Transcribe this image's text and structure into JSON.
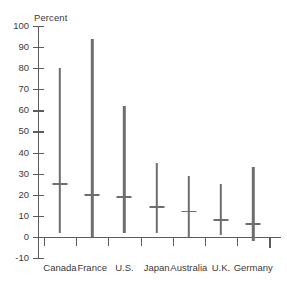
{
  "chart_data": {
    "type": "bar",
    "subtype": "range-with-median-marker",
    "title": "",
    "xlabel": "",
    "ylabel": "Percent",
    "ylim": [
      -10,
      100
    ],
    "yticks": [
      100,
      90,
      80,
      70,
      60,
      50,
      40,
      30,
      20,
      10,
      0,
      -10
    ],
    "ytick_labels": [
      "100",
      "90",
      "80",
      "70",
      "60",
      "50",
      "40",
      "30",
      "20",
      "10",
      "0",
      "-10"
    ],
    "grid": false,
    "legend": false,
    "categories": [
      "Canada",
      "France",
      "U.S.",
      "Japan",
      "Australia",
      "U.K.",
      "Germany"
    ],
    "series": [
      {
        "name": "Range maximum",
        "values": [
          80,
          94,
          62,
          35,
          29,
          25,
          33
        ]
      },
      {
        "name": "Range minimum",
        "values": [
          2,
          0,
          2,
          2,
          0,
          1,
          -2
        ]
      },
      {
        "name": "Median marker",
        "values": [
          25,
          20,
          19,
          14,
          12,
          8,
          6
        ]
      }
    ],
    "points": [
      {
        "category": "Canada",
        "min": 2,
        "max": 80,
        "median": 25
      },
      {
        "category": "France",
        "min": 0,
        "max": 94,
        "median": 20
      },
      {
        "category": "U.S.",
        "min": 2,
        "max": 62,
        "median": 19
      },
      {
        "category": "Japan",
        "min": 2,
        "max": 35,
        "median": 14
      },
      {
        "category": "Australia",
        "min": 0,
        "max": 29,
        "median": 12
      },
      {
        "category": "U.K.",
        "min": 1,
        "max": 25,
        "median": 8
      },
      {
        "category": "Germany",
        "min": -2,
        "max": 33,
        "median": 6
      }
    ],
    "colors": {
      "bar": "#6e6e6e",
      "axis": "#5c5c5c",
      "text": "#3a3a3a",
      "background": "#ffffff"
    }
  }
}
